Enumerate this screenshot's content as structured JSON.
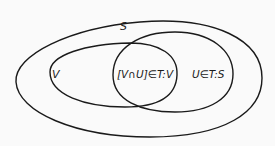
{
  "diagram": {
    "type": "venn-euler",
    "sets": [
      {
        "id": "S",
        "label": "S",
        "role": "outer set"
      },
      {
        "id": "V",
        "label": "V",
        "role": "subset of S"
      },
      {
        "id": "U",
        "label": "U∈T:S",
        "role": "subset of S, open in S"
      }
    ],
    "intersection_label": "[V∩U]∈T:V",
    "stroke_color": "#1a1a1a",
    "background": "#fafafa"
  }
}
